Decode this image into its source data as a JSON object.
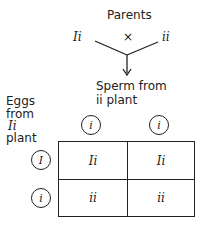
{
  "title": "Parents",
  "cross": {
    "parent_left": "Ii",
    "symbol": "×",
    "parent_right": "ii"
  },
  "sperm_label": {
    "line1": "Sperm from",
    "line2": "ii plant"
  },
  "eggs_label": {
    "line1": "Eggs",
    "line2": "from",
    "line3": "Ii",
    "line4": "plant"
  },
  "punnett": {
    "col_gametes": [
      "i",
      "i"
    ],
    "row_gametes": [
      "I",
      "i"
    ],
    "cells": [
      [
        "Ii",
        "Ii"
      ],
      [
        "ii",
        "ii"
      ]
    ]
  }
}
